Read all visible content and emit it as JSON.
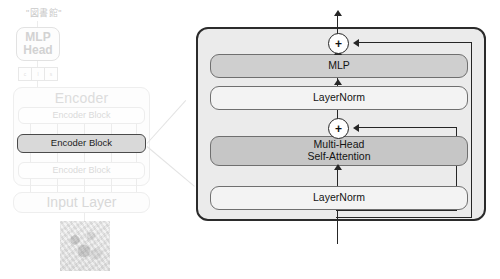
{
  "diagram": {
    "colors": {
      "panel_fill": "#ebebeb",
      "panel_border": "#2b2b2b",
      "highlight_fill": "#d9d9d9",
      "highlight_border": "#4a4a4a",
      "mlp_fill": "#cfcfcf",
      "attention_fill": "#c6c6c6",
      "layernorm_fill": "#f3f3f3",
      "faded_text": "#d8d8d8",
      "wire": "#262626"
    }
  },
  "overview": {
    "class_label": "\"図書館\"",
    "mlp_head": {
      "line1": "MLP",
      "line2": "Head"
    },
    "tokens": [
      {
        "label": "c"
      },
      {
        "label": "l"
      },
      {
        "label": "s"
      }
    ],
    "encoder": {
      "title": "Encoder",
      "blocks": [
        {
          "label": "Encoder Block",
          "highlighted": false
        },
        {
          "label": "Encoder Block",
          "highlighted": true
        },
        {
          "label": "Encoder Block",
          "highlighted": false
        }
      ]
    },
    "input_layer": {
      "label": "Input Layer"
    },
    "input_image": {
      "alt": "library photograph thumbnail"
    }
  },
  "detail": {
    "mlp": {
      "label": "MLP"
    },
    "layernorm_top": {
      "label": "LayerNorm"
    },
    "attention": {
      "line1": "Multi-Head",
      "line2": "Self-Attention"
    },
    "layernorm_bottom": {
      "label": "LayerNorm"
    },
    "residual_add_top": {
      "symbol": "+"
    },
    "residual_add_bottom": {
      "symbol": "+"
    }
  }
}
